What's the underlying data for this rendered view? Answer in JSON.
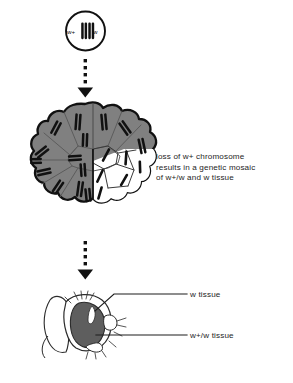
{
  "figure": {
    "caption": "loss of w+ chromosome\nresults in a genetic mosaic\nof w+/w and w tissue",
    "colors": {
      "outline": "#111111",
      "chromosome": "#111111",
      "mosaic_gray": "#808080",
      "mosaic_white": "#ffffff",
      "cell_divider": "#5c5c5c",
      "fly_eye_dark": "#5e5e5e",
      "fly_eye_light": "#ffffff",
      "fly_line": "#2b2b2b",
      "background": "#ffffff",
      "text": "#1d1d1d"
    }
  },
  "zygote": {
    "name": "founder cell",
    "genotype_left": "w+",
    "genotype_right": "w",
    "chromosome_count": 2,
    "chromosome_pairs": 2
  },
  "arrows": [
    {
      "name": "arrow-zygote-to-embryo",
      "style": "dotted",
      "dot_count": 4,
      "direction": "down"
    },
    {
      "name": "arrow-embryo-to-fly",
      "style": "dotted",
      "dot_count": 4,
      "direction": "down"
    }
  ],
  "embryo": {
    "name": "cell cluster",
    "gray_region_label": "w+/w cells",
    "white_region_label": "w cells",
    "gray_cell_count": 14,
    "white_cell_count": 6,
    "gray_cell_chromosomes_each": 2,
    "white_cell_chromosomes_each": 1
  },
  "fly": {
    "name": "adult fly head",
    "labels": [
      {
        "id": "w-tissue",
        "text": "w tissue"
      },
      {
        "id": "wplus-w-tissue",
        "text": "w+/w tissue"
      }
    ]
  }
}
